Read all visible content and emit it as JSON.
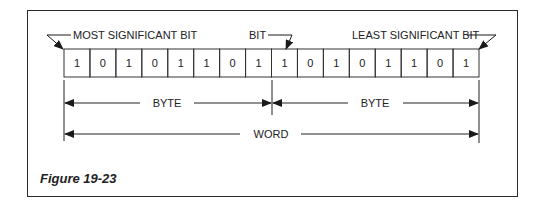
{
  "figure": {
    "caption": "Figure 19-23",
    "labels": {
      "msb": "MOST SIGNIFICANT BIT",
      "bit": "BIT",
      "lsb": "LEAST SIGNIFICANT BIT",
      "byte_left": "BYTE",
      "byte_right": "BYTE",
      "word": "WORD"
    },
    "bits": [
      "1",
      "0",
      "1",
      "0",
      "1",
      "1",
      "0",
      "1",
      "1",
      "0",
      "1",
      "0",
      "1",
      "1",
      "0",
      "1"
    ]
  }
}
